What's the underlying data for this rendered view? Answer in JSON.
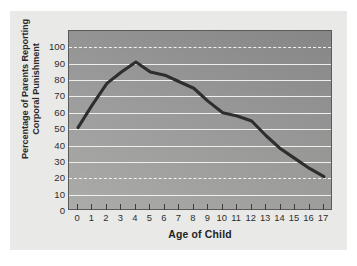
{
  "chart_data": {
    "type": "line",
    "title": "",
    "subtitle": "",
    "xlabel": "Age of Child",
    "ylabel": "Percentage of Parents Reporting Corporal Punishment",
    "ylabel_lines": [
      "Percentage of Parents Reporting",
      "Corporal Punishment"
    ],
    "x": [
      0,
      1,
      2,
      3,
      4,
      5,
      6,
      7,
      8,
      9,
      10,
      11,
      12,
      13,
      14,
      15,
      16,
      17
    ],
    "values": [
      51,
      65,
      78,
      85,
      91,
      85,
      83,
      79,
      75,
      67,
      60,
      58,
      55,
      46,
      38,
      32,
      26,
      21
    ],
    "categories": [
      "0",
      "1",
      "2",
      "3",
      "4",
      "5",
      "6",
      "7",
      "8",
      "9",
      "10",
      "11",
      "12",
      "13",
      "14",
      "15",
      "16",
      "17"
    ],
    "xlim": [
      0,
      17
    ],
    "ylim": [
      0,
      110
    ],
    "xticks": [
      "0",
      "1",
      "2",
      "3",
      "4",
      "5",
      "6",
      "7",
      "8",
      "9",
      "10",
      "11",
      "12",
      "13",
      "14",
      "15",
      "16",
      "17"
    ],
    "yticks": [
      "100",
      "90",
      "80",
      "70",
      "60",
      "50",
      "40",
      "30",
      "20",
      "10",
      "0"
    ],
    "ytick_values": [
      100,
      90,
      80,
      70,
      60,
      50,
      40,
      30,
      20,
      10,
      0
    ],
    "gridlines_solid": [
      90,
      80,
      70,
      60,
      50,
      40,
      30,
      10
    ],
    "gridlines_dashed": [
      100,
      20
    ],
    "grid": true,
    "legend": "none",
    "series": [
      {
        "name": "Percentage of Parents Reporting Corporal Punishment",
        "values": [
          51,
          65,
          78,
          85,
          91,
          85,
          83,
          79,
          75,
          67,
          60,
          58,
          55,
          46,
          38,
          32,
          26,
          21
        ]
      }
    ],
    "colors": {
      "line": "#2e2e2e",
      "plot_background": "#999999",
      "gridline": "#eeeeea",
      "card_background": "#e9e9e7",
      "axis_border": "#5a5a5a",
      "text": "#2d2d2d"
    },
    "line_width": 3.1,
    "peak": {
      "x": 4,
      "y": 91
    }
  }
}
